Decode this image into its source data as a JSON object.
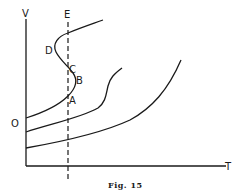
{
  "figure": {
    "caption": "Fig. 15",
    "axes": {
      "y_label": "V",
      "x_label": "T",
      "origin_side_label": "O"
    },
    "vertical_line": {
      "label": "E",
      "style": "dashed"
    },
    "points": {
      "A": "A",
      "B": "B",
      "C": "C",
      "D": "D"
    },
    "curves": [
      {
        "name": "upper S-shaped isotherm",
        "shape": "s-curve"
      },
      {
        "name": "middle isotherm",
        "shape": "s-curve"
      },
      {
        "name": "lower isotherm",
        "shape": "monotonic"
      }
    ],
    "colors": {
      "ink": "#1a1a1a",
      "background": "#ffffff"
    }
  }
}
